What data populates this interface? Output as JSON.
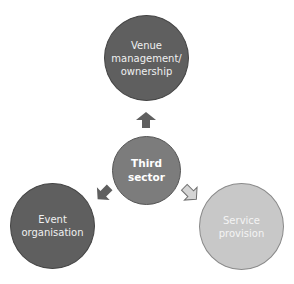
{
  "diagram": {
    "type": "radial-relationship",
    "center": {
      "label": "Third\nsector",
      "color": "#7c7c7c"
    },
    "nodes": [
      {
        "id": "top",
        "label": "Venue\nmanagement/\nownership",
        "color": "#5f5f5f",
        "arrow_style": "solid-dark"
      },
      {
        "id": "left",
        "label": "Event\norganisation",
        "color": "#5f5f5f",
        "arrow_style": "solid-dark"
      },
      {
        "id": "right",
        "label": "Service\nprovision",
        "color": "#c8c8c8",
        "arrow_style": "outlined-light"
      }
    ],
    "edges": [
      {
        "from": "center",
        "to": "top",
        "icon": "arrow-up-icon"
      },
      {
        "from": "center",
        "to": "left",
        "icon": "arrow-down-left-icon"
      },
      {
        "from": "center",
        "to": "right",
        "icon": "arrow-down-right-icon"
      }
    ]
  }
}
